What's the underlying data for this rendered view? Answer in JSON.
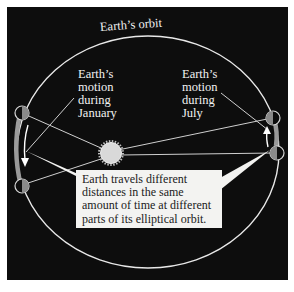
{
  "diagram": {
    "labels": {
      "orbit": "Earth’s orbit",
      "january": "Earth’s\nmotion\nduring\nJanuary",
      "july": "Earth’s\nmotion\nduring\nJuly"
    },
    "callout": {
      "text": "Earth travels different distances in the same amount of time at different parts of its elliptical orbit."
    },
    "elements": {
      "sun": "sun-icon",
      "earth_positions": [
        "january-start",
        "january-end",
        "july-start",
        "july-end"
      ],
      "motion_arrows": [
        "january-arrow-down",
        "july-arrow-up"
      ]
    },
    "colors": {
      "background": "#0d0d0d",
      "orbit_line": "#e8e8e8",
      "sun": "#d9d9d9",
      "earth_shade": "#8a8a8a",
      "arc_band": "#9a9a9a",
      "callout_bg": "#f3f3f1",
      "text_light": "#f2f2f2",
      "text_dark": "#1a1a1a"
    }
  }
}
